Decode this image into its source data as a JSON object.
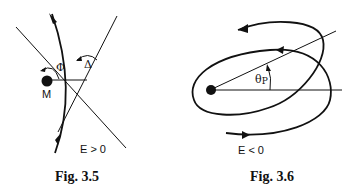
{
  "figures": [
    {
      "caption": "Fig. 3.5",
      "condition_label": "E > 0",
      "mass_label": "M",
      "angle_labels": {
        "phi": "Φ",
        "delta": "Δ"
      },
      "description": "Hyperbolic trajectory around mass M with asymptotes and deflection angle Δ"
    },
    {
      "caption": "Fig. 3.6",
      "condition_label": "E < 0",
      "angle_labels": {
        "theta": "θ",
        "theta_sub": "P"
      },
      "description": "Precessing elliptical orbit with perihelion shift angle θP"
    }
  ],
  "colors": {
    "ink": "#111111",
    "background": "#ffffff"
  }
}
